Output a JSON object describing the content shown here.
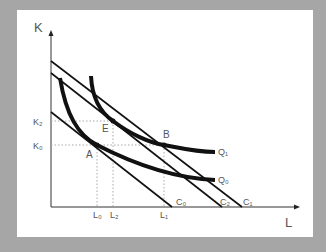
{
  "diagram": {
    "axes": {
      "y_label": "K",
      "x_label": "L"
    },
    "y_ticks": [
      {
        "label": "K₂",
        "y": 121
      },
      {
        "label": "K₀",
        "y": 145
      }
    ],
    "x_ticks": [
      {
        "label": "L₀",
        "x": 97
      },
      {
        "label": "L₂",
        "x": 113
      },
      {
        "label": "L₁",
        "x": 164
      }
    ],
    "points": [
      {
        "label": "A"
      },
      {
        "label": "E"
      },
      {
        "label": "B"
      }
    ],
    "isocost_lines": [
      {
        "label": "C₀"
      },
      {
        "label": "C₂"
      },
      {
        "label": "C₁"
      }
    ],
    "isoquants": [
      {
        "label": "Q₁"
      },
      {
        "label": "Q₀"
      }
    ],
    "colors": {
      "background": "#a6a6a6",
      "panel": "#ffffff",
      "curve": "#111111",
      "text": "#555555",
      "guide": "#aaaaaa"
    }
  }
}
